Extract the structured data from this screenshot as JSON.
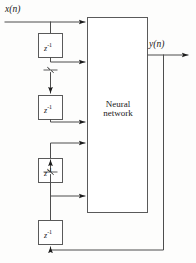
{
  "figure": {
    "kind": "block-diagram",
    "background_color": "#fdfdfc",
    "line_color": "#4d4d4d",
    "text_color": "#1a1a1a"
  },
  "labels": {
    "input": "x(n)",
    "output": "y(n)",
    "network_line1": "Neural",
    "network_line2": "network",
    "delay": "z",
    "delay_exponent": "-1"
  },
  "blocks": {
    "network": {
      "name": "Neural network",
      "x": 87,
      "y": 17,
      "width": 61,
      "height": 196
    },
    "delays": [
      {
        "id": "delay-1",
        "label": "z-1",
        "x": 38,
        "y": 33,
        "width": 25,
        "height": 25
      },
      {
        "id": "delay-2",
        "label": "z-1",
        "x": 38,
        "y": 95,
        "width": 25,
        "height": 25
      },
      {
        "id": "delay-3",
        "label": "z-1",
        "x": 38,
        "y": 158,
        "width": 25,
        "height": 25
      },
      {
        "id": "delay-4",
        "label": "z-1",
        "x": 38,
        "y": 220,
        "width": 25,
        "height": 25
      }
    ]
  },
  "signals": {
    "input_line_y": 22,
    "output_line_y": 55,
    "feedback_line_y": 250,
    "network_input_arrow_ys": [
      22,
      62,
      122,
      143,
      196
    ],
    "break_symbol_ys": [
      70,
      172
    ]
  }
}
